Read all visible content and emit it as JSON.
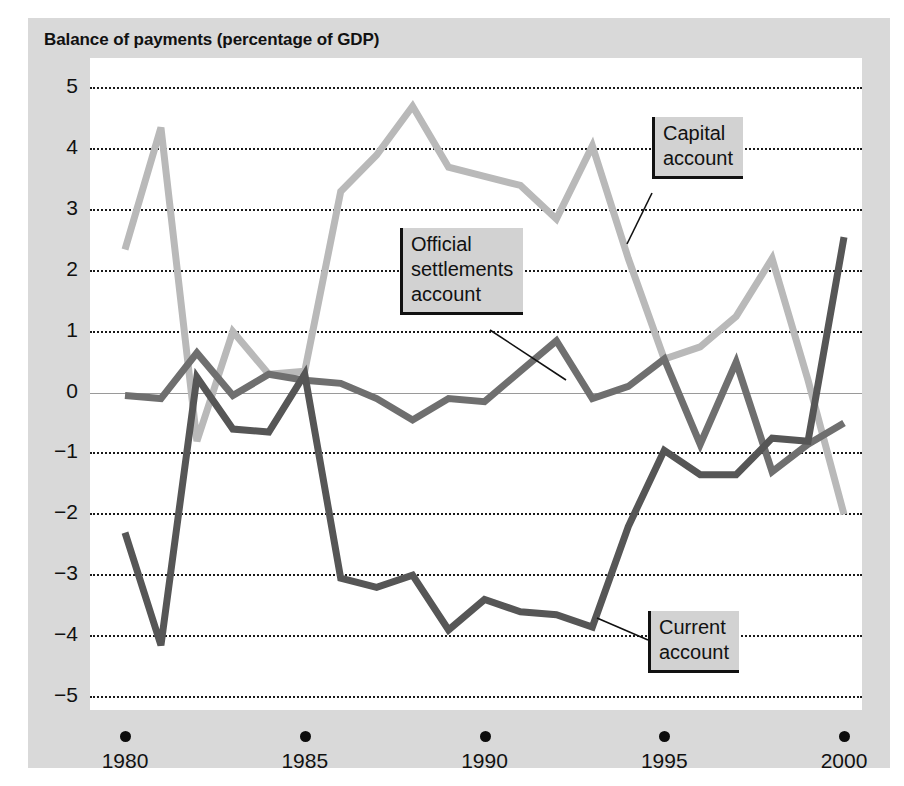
{
  "figure": {
    "title": "Balance of payments (percentage of GDP)",
    "background_color": "#d9d9d9",
    "plot_background_color": "#ffffff"
  },
  "axes": {
    "x_caption": "Year",
    "x_tick_labels": [
      "1980",
      "1985",
      "1990",
      "1995",
      "2000"
    ],
    "y_tick_labels": [
      "5",
      "4",
      "3",
      "2",
      "1",
      "0",
      "−1",
      "−2",
      "−3",
      "−4",
      "−5"
    ]
  },
  "callouts": {
    "capital": "Capital\naccount",
    "official": "Official\nsettlements\naccount",
    "current": "Current\naccount"
  },
  "chart_data": {
    "type": "line",
    "title": "Balance of payments (percentage of GDP)",
    "xlabel": "Year",
    "ylabel": "Balance of payments (percentage of GDP)",
    "xlim": [
      1980,
      2000
    ],
    "ylim": [
      -5,
      5
    ],
    "xticks": [
      1980,
      1985,
      1990,
      1995,
      2000
    ],
    "yticks": [
      -5,
      -4,
      -3,
      -2,
      -1,
      0,
      1,
      2,
      3,
      4,
      5
    ],
    "grid": "horizontal-dotted",
    "zero_line": true,
    "legend": "inline-callouts",
    "x": [
      1980,
      1981,
      1982,
      1983,
      1984,
      1985,
      1986,
      1987,
      1988,
      1989,
      1990,
      1991,
      1992,
      1993,
      1994,
      1995,
      1996,
      1997,
      1998,
      1999,
      2000
    ],
    "series": [
      {
        "name": "Capital account",
        "color": "#b9b9b9",
        "values": [
          2.35,
          4.35,
          -0.8,
          1.0,
          0.3,
          0.35,
          3.3,
          3.9,
          4.7,
          3.7,
          3.55,
          3.4,
          2.85,
          4.05,
          2.2,
          0.55,
          0.75,
          1.25,
          2.2,
          0.2,
          -2.0
        ]
      },
      {
        "name": "Official settlements account",
        "color": "#6f6f6f",
        "values": [
          -0.05,
          -0.1,
          0.65,
          -0.05,
          0.3,
          0.2,
          0.15,
          -0.1,
          -0.45,
          -0.1,
          -0.15,
          0.35,
          0.85,
          -0.1,
          0.1,
          0.55,
          -0.85,
          0.5,
          -1.3,
          -0.85,
          -0.5
        ]
      },
      {
        "name": "Current account",
        "color": "#565656",
        "values": [
          -2.3,
          -4.15,
          0.25,
          -0.6,
          -0.65,
          0.3,
          -3.05,
          -3.2,
          -3.0,
          -3.9,
          -3.4,
          -3.6,
          -3.65,
          -3.85,
          -2.2,
          -0.95,
          -1.35,
          -1.35,
          -0.75,
          -0.8,
          2.55
        ]
      }
    ]
  }
}
